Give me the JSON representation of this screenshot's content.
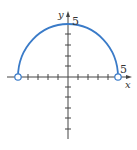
{
  "figure": {
    "type": "function-graph",
    "curve_color": "#3a7bc8",
    "axis_color": "#444444",
    "x_axis_label": "x",
    "y_axis_label": "y",
    "x_tick_label": "5",
    "y_tick_label": "5",
    "radius": 5,
    "endpoints": [
      {
        "x": -5,
        "y": 0,
        "style": "open"
      },
      {
        "x": 5,
        "y": 0,
        "style": "open"
      }
    ],
    "x_ticks": [
      -5,
      -4,
      -3,
      -2,
      -1,
      1,
      2,
      3,
      4,
      5
    ],
    "y_ticks": [
      -6,
      -5,
      -4,
      -3,
      -2,
      -1,
      1,
      2,
      3,
      4,
      5
    ]
  }
}
